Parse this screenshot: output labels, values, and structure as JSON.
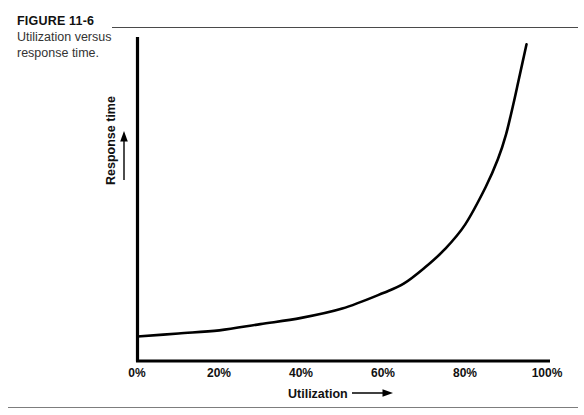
{
  "figure": {
    "number": "FIGURE 11-6",
    "caption": "Utilization versus response time."
  },
  "chart_data": {
    "type": "line",
    "title": "Utilization versus response time.",
    "xlabel": "Utilization",
    "ylabel": "Response time",
    "xlim": [
      0,
      100
    ],
    "ylim": [
      0,
      1
    ],
    "grid": false,
    "legend": null,
    "x_tick_labels": [
      "0%",
      "20%",
      "40%",
      "60%",
      "80%",
      "100%"
    ],
    "x_tick_values": [
      0,
      20,
      40,
      60,
      80,
      100
    ],
    "y_tick_labels": [],
    "x_axis_arrow": true,
    "y_axis_arrow": true,
    "series": [
      {
        "name": "Response time",
        "x": [
          0,
          10,
          20,
          30,
          40,
          50,
          60,
          65,
          70,
          75,
          80,
          85,
          88,
          90,
          92,
          93,
          94,
          95
        ],
        "y": [
          0.04,
          0.05,
          0.06,
          0.08,
          0.1,
          0.13,
          0.18,
          0.21,
          0.26,
          0.32,
          0.4,
          0.52,
          0.61,
          0.69,
          0.8,
          0.86,
          0.92,
          0.98
        ]
      }
    ]
  },
  "colors": {
    "curve": "#000000",
    "axis": "#000000",
    "rule": "#4a4a4a",
    "footer_rule": "#7d7d7d",
    "text": "#111111",
    "caption_text": "#333333",
    "background": "#ffffff"
  }
}
